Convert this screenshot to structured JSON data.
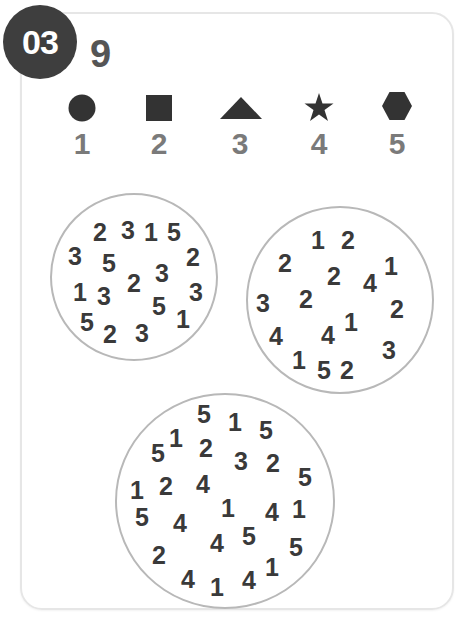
{
  "header": {
    "badge_number": "03",
    "answer": "9"
  },
  "legend": [
    {
      "shape": "circle",
      "value": "1"
    },
    {
      "shape": "square",
      "value": "2"
    },
    {
      "shape": "triangle",
      "value": "3"
    },
    {
      "shape": "star",
      "value": "4"
    },
    {
      "shape": "hexagon",
      "value": "5"
    }
  ],
  "colors": {
    "badge_bg": "#3e3e3e",
    "shape_fill": "#333333",
    "label_text": "#7a7a7a",
    "number_text": "#3a3a3a",
    "circle_border": "#b8b8b8",
    "card_border": "#e6e6e6"
  },
  "circles": [
    {
      "numbers": [
        "2",
        "3",
        "1",
        "5",
        "3",
        "5",
        "2",
        "2",
        "3",
        "1",
        "3",
        "2",
        "3",
        "5",
        "1",
        "5",
        "2",
        "3"
      ]
    },
    {
      "numbers": [
        "1",
        "2",
        "2",
        "1",
        "2",
        "4",
        "3",
        "2",
        "2",
        "4",
        "1",
        "4",
        "1",
        "3",
        "5",
        "2"
      ]
    },
    {
      "numbers": [
        "5",
        "1",
        "5",
        "1",
        "5",
        "2",
        "3",
        "2",
        "5",
        "1",
        "2",
        "4",
        "1",
        "1",
        "4",
        "5",
        "4",
        "4",
        "5",
        "5",
        "2",
        "4",
        "1",
        "4",
        "1"
      ]
    }
  ]
}
